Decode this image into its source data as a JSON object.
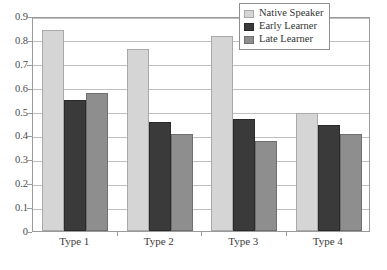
{
  "chart_data": {
    "type": "bar",
    "title": "",
    "xlabel": "",
    "ylabel": "",
    "categories": [
      "Type 1",
      "Type 2",
      "Type 3",
      "Type 4"
    ],
    "series": [
      {
        "name": "Native Speaker",
        "color": "#d5d5d5",
        "values": [
          0.84,
          0.76,
          0.817,
          0.495
        ]
      },
      {
        "name": "Early Learner",
        "color": "#3a3a3a",
        "values": [
          0.548,
          0.457,
          0.467,
          0.445
        ]
      },
      {
        "name": "Late Learner",
        "color": "#8e8e8e",
        "values": [
          0.578,
          0.408,
          0.378,
          0.407
        ]
      }
    ],
    "ylim": [
      0,
      0.9
    ],
    "ytick_values": [
      0,
      0.1,
      0.2,
      0.3,
      0.4,
      0.5,
      0.6,
      0.7,
      0.8,
      0.9
    ],
    "ytick_labels": [
      "0",
      "0.1",
      "0.2",
      "0.3",
      "0.4",
      "0.5",
      "0.6",
      "0.7",
      "0.8",
      "0.9"
    ],
    "grid": true,
    "grid_axis": "y",
    "grid_color": "#c0c0c0",
    "legend_position": "top-right",
    "background_color": "#ffffff",
    "axis_color": "#9a9a9a"
  },
  "legend": {
    "entries": [
      {
        "label": "Native Speaker"
      },
      {
        "label": "Early Learner"
      },
      {
        "label": "Late Learner"
      }
    ]
  }
}
